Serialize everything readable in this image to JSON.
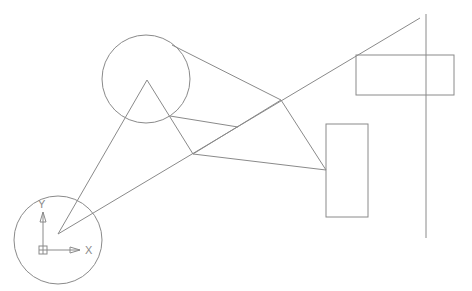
{
  "viewport": {
    "background": "#ffffff",
    "stroke_color": "#8a8a8a"
  },
  "ucs_icon": {
    "icon": "ucs-axis-icon",
    "x_label": "X",
    "y_label": "Y"
  },
  "drawing": {
    "circles": [
      {
        "name": "left-bottom-circle",
        "cx": 58,
        "cy": 240,
        "r": 44
      },
      {
        "name": "upper-circle",
        "cx": 146,
        "cy": 79,
        "r": 44
      }
    ],
    "rectangles": [
      {
        "name": "top-right-rectangle",
        "x": 356,
        "y": 55,
        "w": 98,
        "h": 40
      },
      {
        "name": "middle-right-rectangle",
        "x": 326,
        "y": 124,
        "w": 42,
        "h": 93
      }
    ],
    "lines": [
      {
        "name": "long-diagonal-line",
        "x1": 58,
        "y1": 234,
        "x2": 420,
        "y2": 18
      },
      {
        "name": "vertical-line",
        "x1": 426,
        "y1": 14,
        "x2": 426,
        "y2": 238
      },
      {
        "name": "triangle-left-edge",
        "x1": 58,
        "y1": 234,
        "x2": 147,
        "y2": 80
      },
      {
        "name": "triangle-right-edge",
        "x1": 147,
        "y1": 80,
        "x2": 193,
        "y2": 154
      },
      {
        "name": "tangent-top-line",
        "x1": 172,
        "y1": 45,
        "x2": 281,
        "y2": 100
      },
      {
        "name": "tangent-bottom-line",
        "x1": 170,
        "y1": 116,
        "x2": 238,
        "y2": 127
      },
      {
        "name": "quad-edge-1",
        "x1": 193,
        "y1": 154,
        "x2": 281,
        "y2": 100
      },
      {
        "name": "quad-edge-2",
        "x1": 281,
        "y1": 100,
        "x2": 326,
        "y2": 170
      },
      {
        "name": "quad-edge-3",
        "x1": 193,
        "y1": 154,
        "x2": 326,
        "y2": 170
      }
    ]
  }
}
